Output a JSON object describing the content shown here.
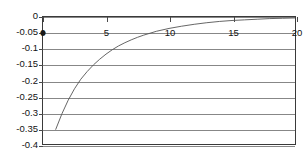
{
  "chart_data": {
    "type": "line",
    "title": "",
    "xlabel": "",
    "ylabel": "",
    "xlim": [
      0,
      20
    ],
    "ylim": [
      -0.4,
      0
    ],
    "grid": true,
    "grid_axis": "y",
    "legend": "none",
    "x_ticks": [
      0,
      5,
      10,
      15,
      20
    ],
    "x_tick_labels": [
      "0",
      "5",
      "10",
      "15",
      "20"
    ],
    "y_ticks": [
      0,
      -0.05,
      -0.1,
      -0.15,
      -0.2,
      -0.25,
      -0.3,
      -0.35,
      -0.4
    ],
    "y_tick_labels": [
      "0",
      "-0.05",
      "-0.1",
      "-0.15",
      "-0.2",
      "-0.25",
      "-0.3",
      "-0.35",
      "-0.4"
    ],
    "series": [
      {
        "name": "curve",
        "color": "#555555",
        "x": [
          1.0,
          1.5,
          2.0,
          2.5,
          3.0,
          3.5,
          4.0,
          4.5,
          5.0,
          5.5,
          6.0,
          6.5,
          7.0,
          7.5,
          8.0,
          9.0,
          10.0,
          11.0,
          12.0,
          13.0,
          14.0,
          15.0,
          16.0,
          17.0,
          18.0,
          19.0,
          20.0
        ],
        "y": [
          -0.355,
          -0.305,
          -0.262,
          -0.226,
          -0.196,
          -0.172,
          -0.151,
          -0.133,
          -0.117,
          -0.103,
          -0.091,
          -0.081,
          -0.072,
          -0.064,
          -0.057,
          -0.045,
          -0.036,
          -0.029,
          -0.023,
          -0.018,
          -0.014,
          -0.011,
          -0.009,
          -0.007,
          -0.005,
          -0.004,
          -0.003
        ]
      }
    ],
    "markers": [
      {
        "name": "origin-point",
        "x": 0,
        "y": -0.05
      }
    ]
  }
}
